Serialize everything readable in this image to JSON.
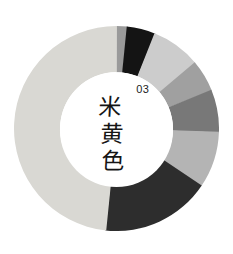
{
  "figure": {
    "background_color": "#ffffff",
    "center": {
      "index": "03",
      "name_chars": [
        "米",
        "黄",
        "色"
      ],
      "name": "米黄色",
      "text_color": "#151515",
      "hole_color": "#ffffff"
    }
  },
  "chart_data": {
    "type": "pie",
    "variant": "donut",
    "title": "",
    "subtitle": "",
    "xlabel": "",
    "ylabel": "",
    "grid": false,
    "legend": "none",
    "center_label": "03 米黄色",
    "start_angle_deg": 0,
    "direction": "clockwise",
    "hole_ratio": 0.55,
    "total_degrees": 360,
    "categories": [
      "swatch-1",
      "swatch-2",
      "swatch-3",
      "swatch-4",
      "swatch-5",
      "swatch-6",
      "swatch-7",
      "swatch-8"
    ],
    "values": [
      6,
      16,
      28,
      18,
      24,
      32,
      62,
      174
    ],
    "colors": [
      "#9a9a9a",
      "#141414",
      "#cccccc",
      "#a0a0a0",
      "#787878",
      "#b4b4b4",
      "#2d2d2d",
      "#d9d8d3"
    ],
    "series": [
      {
        "name": "segment degrees",
        "values": [
          6,
          16,
          28,
          18,
          24,
          32,
          62,
          174
        ]
      }
    ],
    "segments": [
      {
        "label": "swatch-1",
        "color": "#9a9a9a",
        "degrees": 6,
        "start": 0,
        "end": 6
      },
      {
        "label": "swatch-2",
        "color": "#141414",
        "degrees": 16,
        "start": 6,
        "end": 22
      },
      {
        "label": "swatch-3",
        "color": "#cccccc",
        "degrees": 28,
        "start": 22,
        "end": 50
      },
      {
        "label": "swatch-4",
        "color": "#a0a0a0",
        "degrees": 18,
        "start": 50,
        "end": 68
      },
      {
        "label": "swatch-5",
        "color": "#787878",
        "degrees": 24,
        "start": 68,
        "end": 92
      },
      {
        "label": "swatch-6",
        "color": "#b4b4b4",
        "degrees": 32,
        "start": 92,
        "end": 124
      },
      {
        "label": "swatch-7",
        "color": "#2d2d2d",
        "degrees": 62,
        "start": 124,
        "end": 186
      },
      {
        "label": "swatch-8",
        "color": "#d9d8d3",
        "degrees": 174,
        "start": 186,
        "end": 360
      }
    ]
  }
}
